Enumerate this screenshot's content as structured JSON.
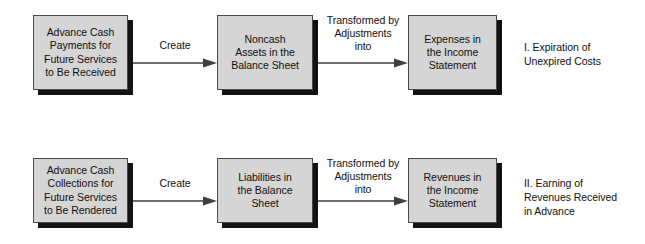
{
  "diagram": {
    "background_color": "#ffffff",
    "box_fill_color": "#d5d5d5",
    "box_border_color": "#4a4a4a",
    "box_shadow_color": "#131313",
    "arrow_color": "#3f3f3f",
    "text_color": "#101010"
  },
  "rows": [
    {
      "id": "row-expiration",
      "boxes": [
        {
          "id": "box-advance-cash-payments",
          "text": "Advance Cash\nPayments for\nFuture Services\nto Be Received"
        },
        {
          "id": "box-noncash-assets",
          "text": "Noncash\nAssets in the\nBalance Sheet"
        },
        {
          "id": "box-expenses-income-statement",
          "text": "Expenses in\nthe Income\nStatement"
        }
      ],
      "arrows": [
        {
          "id": "arrow-create-1",
          "label": "Create"
        },
        {
          "id": "arrow-transformed-1",
          "label": "Transformed by\nAdjustments\ninto"
        }
      ],
      "caption": "I.  Expiration of\nUnexpired Costs"
    },
    {
      "id": "row-earning",
      "boxes": [
        {
          "id": "box-advance-cash-collections",
          "text": "Advance Cash\nCollections for\nFuture Services\nto Be Rendered"
        },
        {
          "id": "box-liabilities-balance-sheet",
          "text": "Liabilities in\nthe Balance\nSheet"
        },
        {
          "id": "box-revenues-income-statement",
          "text": "Revenues in\nthe Income\nStatement"
        }
      ],
      "arrows": [
        {
          "id": "arrow-create-2",
          "label": "Create"
        },
        {
          "id": "arrow-transformed-2",
          "label": "Transformed by\nAdjustments\ninto"
        }
      ],
      "caption": "II.  Earning of\nRevenues Received\nin Advance"
    }
  ]
}
